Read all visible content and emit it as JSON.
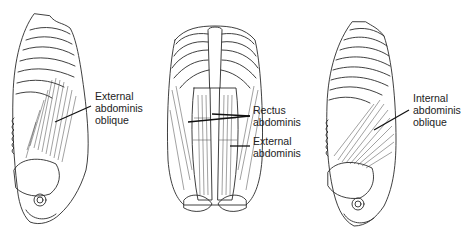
{
  "figures": [
    {
      "id": "left-lateral",
      "view": "lateral torso",
      "label": {
        "lines": [
          "External",
          "abdominis",
          "oblique"
        ]
      }
    },
    {
      "id": "center-anterior",
      "view": "anterior torso",
      "labels": [
        {
          "lines": [
            "Rectus",
            "abdominis"
          ]
        },
        {
          "lines": [
            "External",
            "abdominis"
          ]
        }
      ]
    },
    {
      "id": "right-lateral",
      "view": "lateral torso",
      "label": {
        "lines": [
          "Internal",
          "abdominis",
          "oblique"
        ]
      }
    }
  ]
}
